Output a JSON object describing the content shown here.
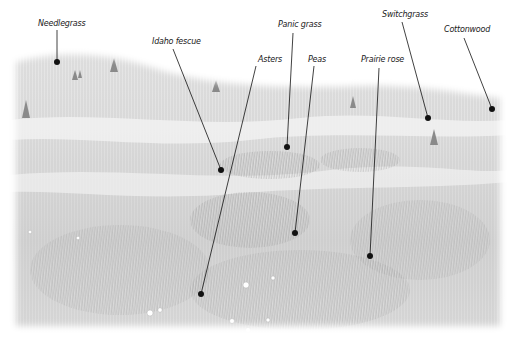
{
  "labels": [
    {
      "text": "Needlegrass",
      "x": 38,
      "y": 19,
      "line": [
        57,
        30,
        57,
        62
      ],
      "dot": [
        57,
        62
      ]
    },
    {
      "text": "Idaho fescue",
      "x": 152,
      "y": 37,
      "line": [
        173,
        49,
        221,
        170
      ],
      "dot": [
        221,
        170
      ]
    },
    {
      "text": "Asters",
      "x": 258,
      "y": 55,
      "line": [
        256,
        66,
        201,
        294
      ],
      "dot": [
        201,
        294
      ]
    },
    {
      "text": "Panic grass",
      "x": 278,
      "y": 20,
      "line": [
        293,
        33,
        287,
        147
      ],
      "dot": [
        287,
        147
      ]
    },
    {
      "text": "Peas",
      "x": 308,
      "y": 55,
      "line": [
        314,
        66,
        295,
        233
      ],
      "dot": [
        295,
        233
      ]
    },
    {
      "text": "Prairie rose",
      "x": 361,
      "y": 55,
      "line": [
        379,
        68,
        370,
        256
      ],
      "dot": [
        370,
        256
      ]
    },
    {
      "text": "Switchgrass",
      "x": 382,
      "y": 10,
      "line": [
        402,
        22,
        428,
        118
      ],
      "dot": [
        428,
        118
      ]
    },
    {
      "text": "Cottonwood",
      "x": 444,
      "y": 25,
      "line": [
        464,
        38,
        492,
        109
      ],
      "dot": [
        492,
        109
      ]
    }
  ],
  "colors": {
    "ink": "#111111",
    "sky": "#ffffff",
    "grass_light": "#e4e4e4",
    "grass_mid": "#c8c8c8",
    "grass_dark": "#9a9a9a"
  }
}
